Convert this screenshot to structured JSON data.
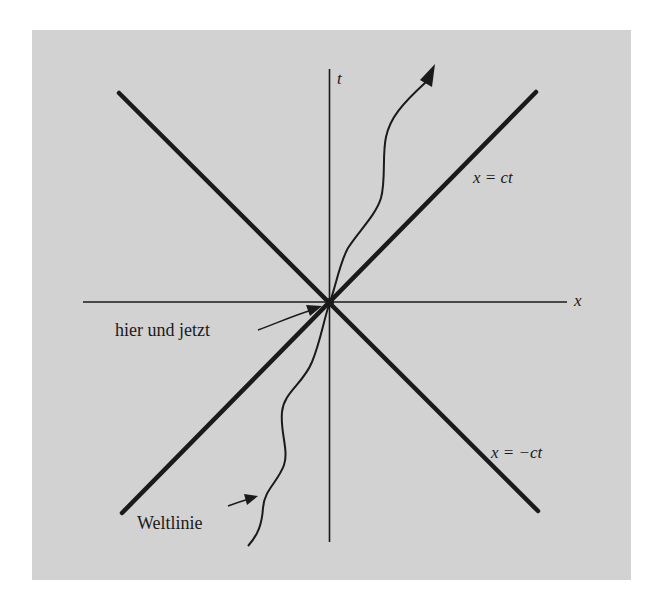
{
  "diagram": {
    "type": "spacetime-light-cone",
    "background_color": "#d2d2d2",
    "line_color": "#1a1a1a",
    "axes": {
      "x_label": "x",
      "t_label": "t"
    },
    "light_cone": {
      "future_right_label": "x = ct",
      "past_right_label": "x = −ct"
    },
    "annotations": {
      "origin_label": "hier und jetzt",
      "worldline_label": "Weltlinie"
    }
  }
}
